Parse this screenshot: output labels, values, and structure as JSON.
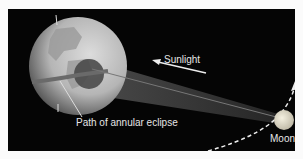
{
  "diagram": {
    "labels": {
      "sunlight": "Sunlight",
      "path": "Path of annular eclipse",
      "moon": "Moon"
    },
    "colors": {
      "background": "#050505",
      "earth_light": "#c9c9c9",
      "earth_dark": "#4a4a4a",
      "shadow": "#3a3a3a",
      "moon": "#e2ddc8",
      "text": "#e6e6e6"
    }
  }
}
